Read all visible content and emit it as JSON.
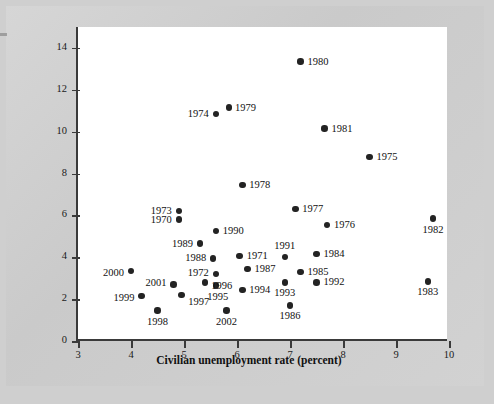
{
  "chart_data": {
    "type": "scatter",
    "title": "",
    "xlabel": "Civilian unemployment rate (percent)",
    "ylabel_lines": [
      "Inflation",
      "(percent per year)"
    ],
    "xlim": [
      3,
      10
    ],
    "ylim": [
      0,
      15
    ],
    "xticks": [
      3,
      4,
      5,
      6,
      7,
      8,
      9,
      10
    ],
    "yticks": [
      0,
      2,
      4,
      6,
      8,
      10,
      12,
      14
    ],
    "grid": false,
    "legend": null,
    "point_color": "#232323",
    "points": [
      {
        "label": "1970",
        "x": 4.9,
        "y": 5.8,
        "lp": "l",
        "dx": -7,
        "dy": 0
      },
      {
        "label": "1971",
        "x": 6.05,
        "y": 4.05,
        "lp": "r",
        "dx": 7,
        "dy": 0
      },
      {
        "label": "1972",
        "x": 5.6,
        "y": 3.2,
        "lp": "l",
        "dx": -7,
        "dy": -1
      },
      {
        "label": "1973",
        "x": 4.9,
        "y": 6.2,
        "lp": "l",
        "dx": -7,
        "dy": 0
      },
      {
        "label": "1974",
        "x": 5.6,
        "y": 10.85,
        "lp": "l",
        "dx": -7,
        "dy": 0
      },
      {
        "label": "1975",
        "x": 8.5,
        "y": 8.8,
        "lp": "r",
        "dx": 7,
        "dy": 0
      },
      {
        "label": "1976",
        "x": 7.7,
        "y": 5.55,
        "lp": "r",
        "dx": 7,
        "dy": 0
      },
      {
        "label": "1977",
        "x": 7.1,
        "y": 6.3,
        "lp": "r",
        "dx": 7,
        "dy": 0
      },
      {
        "label": "1978",
        "x": 6.1,
        "y": 7.45,
        "lp": "r",
        "dx": 7,
        "dy": 0
      },
      {
        "label": "1979",
        "x": 5.85,
        "y": 11.15,
        "lp": "r",
        "dx": 6,
        "dy": 0
      },
      {
        "label": "1980",
        "x": 7.2,
        "y": 13.35,
        "lp": "r",
        "dx": 7,
        "dy": 0
      },
      {
        "label": "1981",
        "x": 7.65,
        "y": 10.15,
        "lp": "r",
        "dx": 7,
        "dy": 0
      },
      {
        "label": "1982",
        "x": 9.7,
        "y": 5.85,
        "lp": "b",
        "dx": 0,
        "dy": 6
      },
      {
        "label": "1983",
        "x": 9.6,
        "y": 2.85,
        "lp": "b",
        "dx": 0,
        "dy": 6
      },
      {
        "label": "1984",
        "x": 7.5,
        "y": 4.15,
        "lp": "r",
        "dx": 7,
        "dy": 0
      },
      {
        "label": "1985",
        "x": 7.2,
        "y": 3.3,
        "lp": "r",
        "dx": 7,
        "dy": 0
      },
      {
        "label": "1986",
        "x": 7.0,
        "y": 1.7,
        "lp": "b",
        "dx": 0,
        "dy": 6
      },
      {
        "label": "1987",
        "x": 6.2,
        "y": 3.45,
        "lp": "r",
        "dx": 7,
        "dy": 0
      },
      {
        "label": "1988",
        "x": 5.55,
        "y": 3.95,
        "lp": "l",
        "dx": -7,
        "dy": 0
      },
      {
        "label": "1989",
        "x": 5.3,
        "y": 4.65,
        "lp": "l",
        "dx": -7,
        "dy": 0
      },
      {
        "label": "1990",
        "x": 5.6,
        "y": 5.25,
        "lp": "r",
        "dx": 7,
        "dy": 0
      },
      {
        "label": "1991",
        "x": 6.9,
        "y": 4.0,
        "lp": "t",
        "dx": 0,
        "dy": -6
      },
      {
        "label": "1992",
        "x": 7.5,
        "y": 2.8,
        "lp": "r",
        "dx": 7,
        "dy": 0
      },
      {
        "label": "1993",
        "x": 6.9,
        "y": 2.8,
        "lp": "b",
        "dx": 0,
        "dy": 6
      },
      {
        "label": "1994",
        "x": 6.1,
        "y": 2.45,
        "lp": "r",
        "dx": 7,
        "dy": 0
      },
      {
        "label": "1995",
        "x": 5.6,
        "y": 2.65,
        "lp": "b",
        "dx": 2,
        "dy": 6
      },
      {
        "label": "1996",
        "x": 5.4,
        "y": 2.8,
        "lp": "r",
        "dx": 6,
        "dy": 4
      },
      {
        "label": "1997",
        "x": 4.95,
        "y": 2.2,
        "lp": "r",
        "dx": 7,
        "dy": 7
      },
      {
        "label": "1998",
        "x": 4.5,
        "y": 1.45,
        "lp": "b",
        "dx": 0,
        "dy": 6
      },
      {
        "label": "1999",
        "x": 4.2,
        "y": 2.15,
        "lp": "l",
        "dx": -7,
        "dy": 2
      },
      {
        "label": "2000",
        "x": 4.0,
        "y": 3.35,
        "lp": "l",
        "dx": -7,
        "dy": 2
      },
      {
        "label": "2001",
        "x": 4.8,
        "y": 2.7,
        "lp": "l",
        "dx": -7,
        "dy": -1
      },
      {
        "label": "2002",
        "x": 5.8,
        "y": 1.45,
        "lp": "b",
        "dx": 0,
        "dy": 6
      }
    ]
  }
}
